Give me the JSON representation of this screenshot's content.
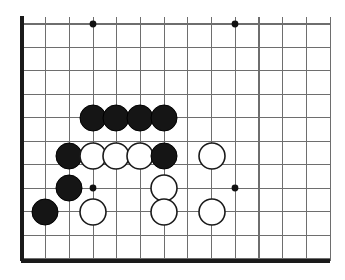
{
  "figure": {
    "kind": "go-board-diagram",
    "background_color": "#ffffff",
    "board_color": "#ffffff",
    "line_color": "#6e6e6e",
    "edge_color": "#1a1a1a",
    "black_stone_color": "#151515",
    "white_stone_color": "#ffffff",
    "white_stone_outline_color": "#1a1a1a",
    "star_point_color": "#111111"
  },
  "board": {
    "view": "partial-crop",
    "columns": 14,
    "rows": 11,
    "origin_x": 22,
    "origin_y": 24,
    "spacing_x": 23.7,
    "spacing_y": 23.45,
    "left_edge_x": 22,
    "bottom_edge_y": 261,
    "right_extent_x": 330,
    "top_extent_y": 24,
    "edge_thickness": 3.2,
    "line_thickness": 1.1,
    "stone_radius": 13,
    "star_point_radius": 3.4
  },
  "star_points": [
    {
      "col": 3,
      "row": 0,
      "x": 93,
      "y": 24
    },
    {
      "col": 9,
      "row": 0,
      "x": 235,
      "y": 24
    },
    {
      "col": 3,
      "row": 7,
      "x": 93,
      "y": 188
    },
    {
      "col": 9,
      "row": 7,
      "x": 235,
      "y": 188
    }
  ],
  "stones": [
    {
      "color": "black",
      "col": 3,
      "row": 4,
      "x": 93,
      "y": 118
    },
    {
      "color": "black",
      "col": 4,
      "row": 4,
      "x": 116,
      "y": 118
    },
    {
      "color": "black",
      "col": 5,
      "row": 4,
      "x": 140,
      "y": 118
    },
    {
      "color": "black",
      "col": 6,
      "row": 4,
      "x": 164,
      "y": 118
    },
    {
      "color": "black",
      "col": 2,
      "row": 5,
      "x": 69,
      "y": 156
    },
    {
      "color": "white",
      "col": 3,
      "row": 5,
      "x": 93,
      "y": 156
    },
    {
      "color": "white",
      "col": 4,
      "row": 5,
      "x": 116,
      "y": 156
    },
    {
      "color": "white",
      "col": 5,
      "row": 5,
      "x": 140,
      "y": 156
    },
    {
      "color": "black",
      "col": 6,
      "row": 5,
      "x": 164,
      "y": 156
    },
    {
      "color": "white",
      "col": 8,
      "row": 5,
      "x": 212,
      "y": 156
    },
    {
      "color": "black",
      "col": 2,
      "row": 7,
      "x": 69,
      "y": 188
    },
    {
      "color": "white",
      "col": 6,
      "row": 7,
      "x": 164,
      "y": 188
    },
    {
      "color": "black",
      "col": 1,
      "row": 8,
      "x": 45,
      "y": 212
    },
    {
      "color": "white",
      "col": 3,
      "row": 8,
      "x": 93,
      "y": 212
    },
    {
      "color": "white",
      "col": 6,
      "row": 8,
      "x": 164,
      "y": 212
    },
    {
      "color": "white",
      "col": 8,
      "row": 8,
      "x": 212,
      "y": 212
    }
  ],
  "counts": {
    "black_stones": 8,
    "white_stones": 8,
    "total_stones": 16
  }
}
